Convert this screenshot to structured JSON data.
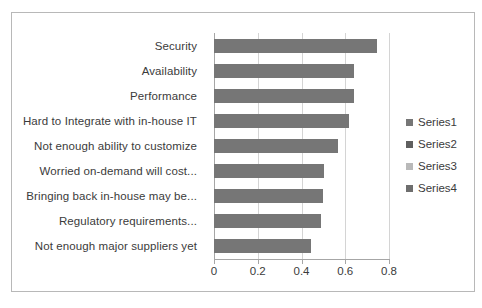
{
  "chart_data": {
    "type": "bar",
    "orientation": "horizontal",
    "title": "",
    "xlabel": "",
    "ylabel": "",
    "xlim": [
      0,
      0.8
    ],
    "grid": true,
    "legend_position": "right",
    "xticks": [
      "0",
      "0.2",
      "0.4",
      "0.6",
      "0.8"
    ],
    "xtick_values": [
      0,
      0.2,
      0.4,
      0.6,
      0.8
    ],
    "categories": [
      "Security",
      "Availability",
      "Performance",
      "Hard to Integrate with in-house IT",
      "Not enough ability to customize",
      "Worried on-demand will cost...",
      "Bringing back in-house may be...",
      "Regulatory requirements...",
      "Not enough major suppliers yet"
    ],
    "values": [
      0.745,
      0.64,
      0.64,
      0.615,
      0.565,
      0.505,
      0.5,
      0.49,
      0.445
    ],
    "series": [
      {
        "name": "Series1",
        "values": [
          0.745,
          0.64,
          0.64,
          0.615,
          0.565,
          0.505,
          0.5,
          0.49,
          0.445
        ]
      }
    ],
    "legend": [
      {
        "label": "Series1",
        "color": "#767676"
      },
      {
        "label": "Series2",
        "color": "#5f5f5f"
      },
      {
        "label": "Series3",
        "color": "#b9b9b9"
      },
      {
        "label": "Series4",
        "color": "#6e6e6e"
      }
    ],
    "colors": {
      "bar": "#767676",
      "gridline": "#d4d4d4",
      "axis": "#a6a6a6",
      "border": "#b8b8b8",
      "text": "#3b3b3b",
      "background": "#ffffff"
    }
  }
}
